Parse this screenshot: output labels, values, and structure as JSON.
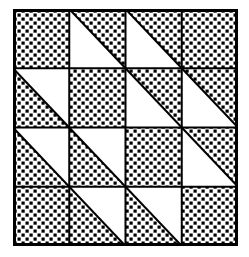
{
  "grid": {
    "rows": 4,
    "cols": 4,
    "colors": {
      "fill": "#000000",
      "background": "#ffffff",
      "line": "#000000"
    },
    "legend": {
      "F": "full checkered square",
      "U": "diagonal TL-BR; upper-right triangle checkered, lower-left white",
      "L": "diagonal TL-BR; lower-left triangle checkered, upper-right white"
    },
    "cells": [
      [
        "F",
        "U",
        "U",
        "F"
      ],
      [
        "L",
        "F",
        "U",
        "U"
      ],
      [
        "L",
        "L",
        "F",
        "U"
      ],
      [
        "F",
        "L",
        "L",
        "F"
      ]
    ]
  }
}
